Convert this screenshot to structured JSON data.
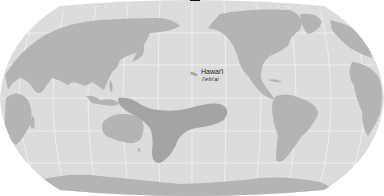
{
  "map": {
    "projection": "Robinson (Pacific-centered)",
    "colors": {
      "ocean": "#dcdcdc",
      "land": "#b4b4b4",
      "range": "#a4a4a4",
      "graticule": "#f2f2f2",
      "background": "#ffffff"
    },
    "labels": [
      {
        "id": "hawaii",
        "text": "Hawai'i",
        "subtext": "I'ehi'ai"
      }
    ]
  }
}
